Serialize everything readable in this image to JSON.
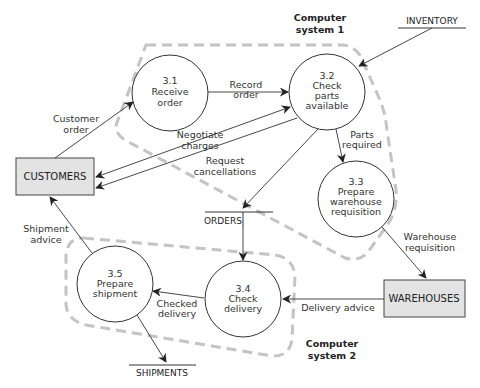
{
  "diagram": {
    "type": "data-flow-diagram",
    "system_boundaries": [
      {
        "id": "sys1",
        "label_line1": "Computer",
        "label_line2": "system 1"
      },
      {
        "id": "sys2",
        "label_line1": "Computer",
        "label_line2": "system 2"
      }
    ],
    "processes": [
      {
        "id": "3.1",
        "number": "3.1",
        "line1": "Receive",
        "line2": "order",
        "line3": ""
      },
      {
        "id": "3.2",
        "number": "3.2",
        "line1": "Check",
        "line2": "parts",
        "line3": "available"
      },
      {
        "id": "3.3",
        "number": "3.3",
        "line1": "Prepare",
        "line2": "warehouse",
        "line3": "requisition"
      },
      {
        "id": "3.4",
        "number": "3.4",
        "line1": "Check",
        "line2": "delivery",
        "line3": ""
      },
      {
        "id": "3.5",
        "number": "3.5",
        "line1": "Prepare",
        "line2": "shipment",
        "line3": ""
      }
    ],
    "external_entities": [
      {
        "id": "customers",
        "label": "CUSTOMERS"
      },
      {
        "id": "warehouses",
        "label": "WAREHOUSES"
      }
    ],
    "data_stores": [
      {
        "id": "inventory",
        "label": "INVENTORY"
      },
      {
        "id": "orders",
        "label": "ORDERS"
      },
      {
        "id": "shipments",
        "label": "SHIPMENTS"
      }
    ],
    "flows": [
      {
        "from": "CUSTOMERS",
        "to": "3.1",
        "line1": "Customer",
        "line2": "order"
      },
      {
        "from": "3.1",
        "to": "3.2",
        "line1": "Record",
        "line2": "order"
      },
      {
        "from": "INVENTORY",
        "to": "3.2",
        "line1": "",
        "line2": ""
      },
      {
        "from": "3.2<->CUSTOMERS",
        "to": "",
        "line1": "Negotiate",
        "line2": "charges"
      },
      {
        "from": "3.2",
        "to": "CUSTOMERS",
        "line1": "Request",
        "line2": "cancellations"
      },
      {
        "from": "3.2",
        "to": "3.3",
        "line1": "Parts",
        "line2": "required"
      },
      {
        "from": "3.2",
        "to": "ORDERS",
        "line1": "",
        "line2": ""
      },
      {
        "from": "ORDERS",
        "to": "3.4",
        "line1": "",
        "line2": ""
      },
      {
        "from": "3.3",
        "to": "WAREHOUSES",
        "line1": "Warehouse",
        "line2": "requisition"
      },
      {
        "from": "WAREHOUSES",
        "to": "3.4",
        "line1": "Delivery advice",
        "line2": ""
      },
      {
        "from": "3.4",
        "to": "3.5",
        "line1": "Checked",
        "line2": "delivery"
      },
      {
        "from": "3.5",
        "to": "CUSTOMERS",
        "line1": "Shipment",
        "line2": "advice"
      },
      {
        "from": "3.5",
        "to": "SHIPMENTS",
        "line1": "",
        "line2": ""
      }
    ]
  }
}
